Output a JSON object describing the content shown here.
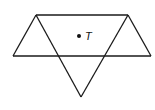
{
  "diagram": {
    "point_label": "T",
    "line_color": "#1a1a1a",
    "stroke_width": 1.3
  }
}
